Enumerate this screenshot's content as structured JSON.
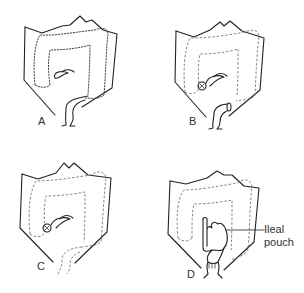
{
  "figure": {
    "panels": [
      {
        "id": "A",
        "label": "A",
        "description": "Intact colon with small bowel, rectum and anus"
      },
      {
        "id": "B",
        "label": "B",
        "description": "Colon removed (dashed), ileum end marked, rectal stump with cut end"
      },
      {
        "id": "C",
        "label": "C",
        "description": "Colon and rectum removed (dashed), ileum end marked"
      },
      {
        "id": "D",
        "label": "D",
        "description": "Ileal pouch connected to anus",
        "callout": {
          "line1": "Ileal",
          "line2": "pouch"
        }
      }
    ],
    "colors": {
      "line": "#222222",
      "dashed": "#777777",
      "background": "#ffffff"
    }
  }
}
